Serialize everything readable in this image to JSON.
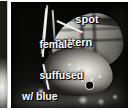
{
  "figure": {
    "type": "annotated-photograph",
    "view": "lateral, wings closed",
    "palette": {
      "background": "#ffffff",
      "photo_background": "#060605",
      "label_text": "#ffffff",
      "leader_line": "#f2f1ec",
      "wing_light": "#f4f3ef",
      "wing_mid": "#97968e",
      "wing_dark": "#2a2926"
    },
    "annotations": [
      {
        "id": "spot-pattern",
        "line1": "spot",
        "line2": "pattern",
        "points_to": "forewing underside markings"
      },
      {
        "id": "female",
        "line1": "female",
        "line2": "",
        "points_to": "specimen sex"
      },
      {
        "id": "suffused-with-blue",
        "line1": "suffused",
        "line2": "w/ blue",
        "points_to": "basal wing coloration"
      }
    ]
  }
}
